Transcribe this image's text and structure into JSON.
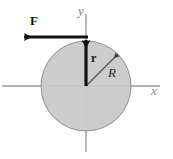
{
  "figure": {
    "canvas": {
      "width": 173,
      "height": 159,
      "background": "#ffffff"
    },
    "colors": {
      "disk_fill": "#c9c9c9",
      "disk_stroke": "#8f8f8f",
      "axis": "#9a9a9a",
      "vector": "#111111",
      "radius_line": "#4a4a4a"
    },
    "origin": {
      "x": 86,
      "y": 86
    },
    "disk": {
      "cx": 86,
      "cy": 86,
      "r": 45
    },
    "axes": {
      "x": {
        "x1": 2,
        "y1": 86,
        "x2": 160,
        "y2": 86,
        "label": "x"
      },
      "y": {
        "x1": 86,
        "y1": 14,
        "x2": 86,
        "y2": 152,
        "label": "y"
      }
    },
    "vectors": [
      {
        "name": "force",
        "label": "F",
        "bold": true,
        "from": {
          "x": 86,
          "y": 37
        },
        "to": {
          "x": 22,
          "y": 37
        },
        "label_pos": {
          "x": 30,
          "y": 14
        }
      },
      {
        "name": "position",
        "label": "r",
        "bold": true,
        "from": {
          "x": 86,
          "y": 86
        },
        "to": {
          "x": 86,
          "y": 39
        },
        "label_pos": {
          "x": 91,
          "y": 52
        }
      }
    ],
    "radius": {
      "name": "radius",
      "label": "R",
      "from": {
        "x": 86,
        "y": 86
      },
      "to": {
        "x": 118,
        "y": 54
      },
      "label_pos": {
        "x": 108,
        "y": 66
      }
    },
    "labels": {
      "force": "F",
      "position": "r",
      "radius": "R",
      "x_axis": "x",
      "y_axis": "y"
    }
  }
}
